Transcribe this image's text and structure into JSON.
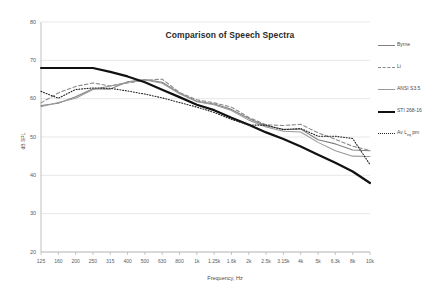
{
  "chart_data": {
    "type": "line",
    "title": "Comparison of Speech Spectra",
    "xlabel": "Frequency, Hz",
    "ylabel": "dB SPL",
    "ylim": [
      20,
      80
    ],
    "ytick_labels": [
      "80",
      "70",
      "60",
      "50",
      "40",
      "30",
      "20"
    ],
    "ytick_values": [
      80,
      70,
      60,
      50,
      40,
      30,
      20
    ],
    "grid": true,
    "grid_axis": "y",
    "legend_position": "right",
    "categories": [
      "125",
      "160",
      "200",
      "250",
      "315",
      "400",
      "500",
      "630",
      "800",
      "1k",
      "1.25k",
      "1.6k",
      "2k",
      "2.5k",
      "3.15k",
      "4k",
      "5k",
      "6.3k",
      "8k",
      "10k"
    ],
    "x_values_hz": [
      125,
      160,
      200,
      250,
      315,
      400,
      500,
      630,
      800,
      1000,
      1250,
      1600,
      2000,
      2500,
      3150,
      4000,
      5000,
      6300,
      8000,
      10000
    ],
    "series": [
      {
        "name": "Byrne",
        "style": "solid",
        "color": "#808080",
        "width": 1.1,
        "values": [
          58.2,
          58.8,
          60.5,
          62.6,
          62.5,
          64.4,
          65.0,
          64.3,
          61.5,
          59.3,
          58.6,
          57.2,
          54.8,
          52.9,
          52.0,
          52.1,
          49.3,
          48.2,
          46.6,
          46.4
        ]
      },
      {
        "name": "Li",
        "style": "dashed",
        "color": "#8a8a8a",
        "width": 1.1,
        "values": [
          58.9,
          61.5,
          63.2,
          64.1,
          63.3,
          64.1,
          64.8,
          65.1,
          61.6,
          59.7,
          58.9,
          57.8,
          55.1,
          53.2,
          53.0,
          53.3,
          51.1,
          49.4,
          47.6,
          46.5
        ]
      },
      {
        "name": "ANSI S3.5",
        "style": "solid",
        "color": "#9a9a9a",
        "width": 1.1,
        "values": [
          57.9,
          59.0,
          60.1,
          62.4,
          63.3,
          64.3,
          64.9,
          64.0,
          61.3,
          59.2,
          58.4,
          56.9,
          54.4,
          52.6,
          51.5,
          51.3,
          48.6,
          46.4,
          45.0,
          44.9
        ]
      },
      {
        "name": "STI 268-16",
        "style": "solid",
        "color": "#111111",
        "width": 2.2,
        "values": [
          68.0,
          68.0,
          68.0,
          68.0,
          67.0,
          65.8,
          64.3,
          62.3,
          60.4,
          58.4,
          57.0,
          55.0,
          53.2,
          51.2,
          49.5,
          47.5,
          45.4,
          43.3,
          41.0,
          38.0
        ]
      },
      {
        "name": "Av L<sub>eq</sub> pm",
        "name_plain": "Av Leq pm",
        "style": "dotted",
        "color": "#222222",
        "width": 1.1,
        "values": [
          61.9,
          60.1,
          62.4,
          62.8,
          62.7,
          62.0,
          61.2,
          60.2,
          59.0,
          57.8,
          56.4,
          54.6,
          53.1,
          53.1,
          51.9,
          52.2,
          50.2,
          50.2,
          49.6,
          42.8
        ]
      }
    ]
  },
  "legend": {
    "items": [
      {
        "label": "Byrne"
      },
      {
        "label": "Li"
      },
      {
        "label": "ANSI S3.5"
      },
      {
        "label": "STI 268-16"
      },
      {
        "label": "Av Leq pm"
      }
    ]
  }
}
